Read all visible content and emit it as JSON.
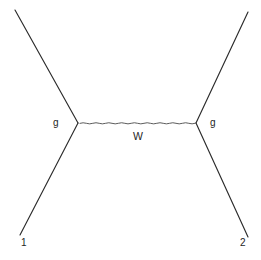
{
  "diagram": {
    "type": "feynman-diagram",
    "background_color": "#ffffff",
    "line_color": "#2b2b2b",
    "propagator_color": "#4a4a4a",
    "label_color": "#252525",
    "canvas": {
      "width": 261,
      "height": 260
    },
    "vertices": [
      {
        "id": "left-vertex",
        "x": 78,
        "y": 123,
        "label": "g"
      },
      {
        "id": "right-vertex",
        "x": 196,
        "y": 123,
        "label": "g"
      }
    ],
    "legs": [
      {
        "id": "upper-left-leg",
        "from": {
          "x": 15,
          "y": 10
        },
        "to": {
          "x": 78,
          "y": 123
        },
        "label": ""
      },
      {
        "id": "lower-left-leg",
        "from": {
          "x": 78,
          "y": 123
        },
        "to": {
          "x": 20,
          "y": 235
        },
        "label": "1"
      },
      {
        "id": "upper-right-leg",
        "from": {
          "x": 196,
          "y": 123
        },
        "to": {
          "x": 248,
          "y": 12
        },
        "label": ""
      },
      {
        "id": "lower-right-leg",
        "from": {
          "x": 196,
          "y": 123
        },
        "to": {
          "x": 248,
          "y": 237
        },
        "label": "2"
      }
    ],
    "propagator": {
      "id": "w-propagator",
      "style": "wavy",
      "from": {
        "x": 80,
        "y": 123
      },
      "to": {
        "x": 194,
        "y": 123
      },
      "label": "W"
    },
    "labels": {
      "vertex_left": "g",
      "vertex_right": "g",
      "propagator": "W",
      "leg_in": "1",
      "leg_out": "2"
    }
  }
}
